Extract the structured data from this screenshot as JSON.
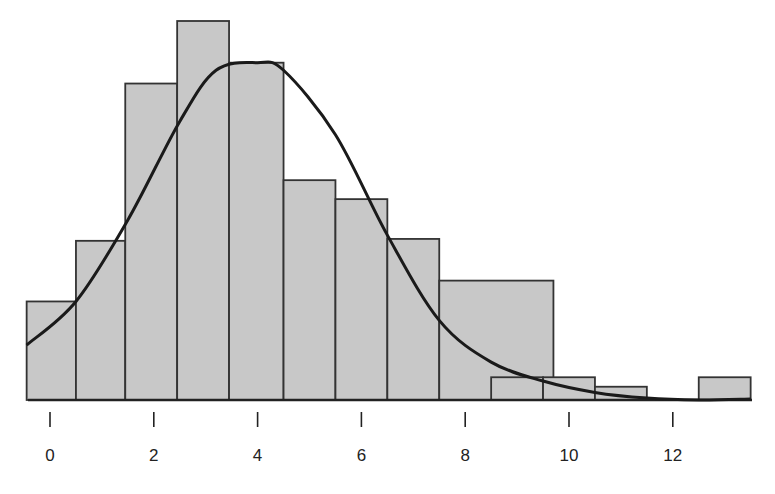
{
  "chart_data": {
    "type": "bar",
    "subtype": "histogram_with_density_curve",
    "title": "",
    "xlabel": "",
    "ylabel": "",
    "x_ticks": [
      0,
      2,
      4,
      6,
      8,
      10,
      12
    ],
    "x_tick_labels": [
      "0",
      "2",
      "4",
      "6",
      "8",
      "10",
      "12"
    ],
    "xlim": [
      -0.45,
      13.5
    ],
    "grid": false,
    "legend": null,
    "y_axis_shown": false,
    "bars": [
      {
        "x0": -0.45,
        "x1": 0.5,
        "height": 5.2
      },
      {
        "x0": 0.5,
        "x1": 1.45,
        "height": 8.4
      },
      {
        "x0": 1.45,
        "x1": 2.45,
        "height": 16.7
      },
      {
        "x0": 2.45,
        "x1": 3.45,
        "height": 20.0
      },
      {
        "x0": 3.45,
        "x1": 4.5,
        "height": 17.8
      },
      {
        "x0": 4.5,
        "x1": 5.5,
        "height": 11.6
      },
      {
        "x0": 5.5,
        "x1": 6.5,
        "height": 10.6
      },
      {
        "x0": 6.5,
        "x1": 7.5,
        "height": 8.5
      },
      {
        "x0": 7.5,
        "x1": 9.7,
        "height": 6.3
      },
      {
        "x0": 8.5,
        "x1": 9.5,
        "height": 1.2
      },
      {
        "x0": 9.5,
        "x1": 10.5,
        "height": 1.2
      },
      {
        "x0": 10.5,
        "x1": 11.5,
        "height": 0.7
      },
      {
        "x0": 12.5,
        "x1": 13.5,
        "height": 1.2
      }
    ],
    "curve": {
      "description": "smooth density curve, peak near x=4",
      "points": [
        [
          -0.45,
          2.9
        ],
        [
          0.5,
          5.2
        ],
        [
          1.5,
          9.5
        ],
        [
          2.5,
          14.7
        ],
        [
          3.2,
          17.4
        ],
        [
          4.0,
          17.8
        ],
        [
          4.5,
          17.4
        ],
        [
          5.5,
          14.0
        ],
        [
          6.5,
          8.7
        ],
        [
          7.5,
          4.2
        ],
        [
          8.5,
          2.0
        ],
        [
          9.5,
          1.0
        ],
        [
          10.5,
          0.4
        ],
        [
          11.5,
          0.1
        ],
        [
          12.5,
          0.0
        ],
        [
          13.5,
          0.05
        ]
      ]
    },
    "colors": {
      "bar_fill": "#c8c8c8",
      "bar_edge": "#333333",
      "curve": "#1a1a1a",
      "background": "#ffffff"
    }
  }
}
